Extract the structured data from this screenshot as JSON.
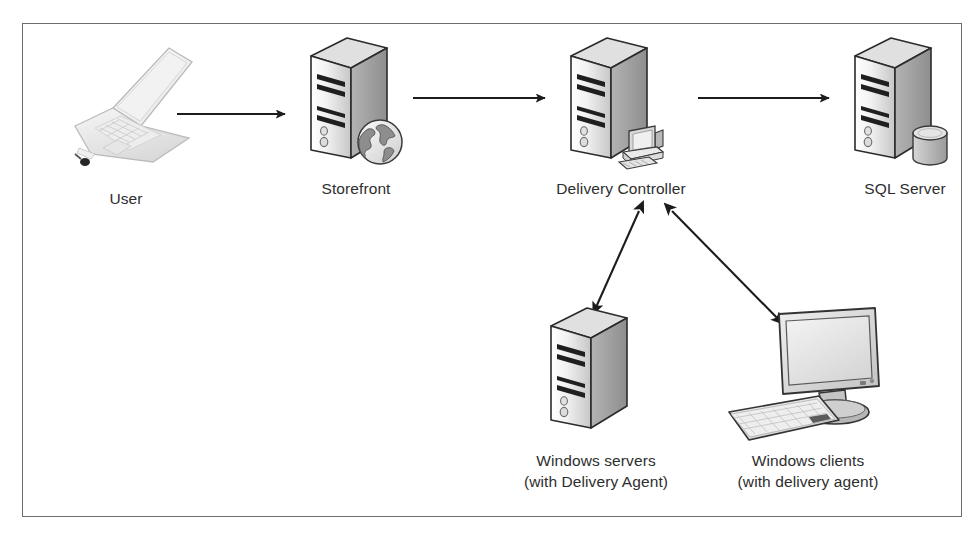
{
  "diagram": {
    "frame": {
      "border_color": "#6d6d6d"
    },
    "text_color": "#2e2e2e",
    "nodes": [
      {
        "id": "user",
        "icon": "laptop-icon",
        "label": "User",
        "sublabel": "",
        "x": 28,
        "y": 18,
        "width": 150,
        "label_y": 146
      },
      {
        "id": "storefront",
        "icon": "server-tower-globe-icon",
        "label": "Storefront",
        "sublabel": "",
        "x": 268,
        "y": 8,
        "width": 130,
        "label_y": 146
      },
      {
        "id": "delivery-controller",
        "icon": "server-tower-desktop-icon",
        "label": "Delivery Controller",
        "sublabel": "",
        "x": 528,
        "y": 8,
        "width": 140,
        "label_y": 146
      },
      {
        "id": "sql-server",
        "icon": "server-tower-database-icon",
        "label": "SQL Server",
        "sublabel": "",
        "x": 812,
        "y": 8,
        "width": 140,
        "label_y": 146
      },
      {
        "id": "windows-servers",
        "icon": "server-tower-icon",
        "label": "Windows servers",
        "sublabel": "(with Delivery Agent)",
        "x": 508,
        "y": 278,
        "width": 130,
        "label_y": 148
      },
      {
        "id": "windows-clients",
        "icon": "desktop-monitor-keyboard-icon",
        "label": "Windows clients",
        "sublabel": "(with delivery agent)",
        "x": 700,
        "y": 272,
        "width": 170,
        "label_y": 154
      }
    ],
    "edges": [
      {
        "id": "user-to-storefront",
        "from": "user",
        "to": "storefront",
        "style": "arrow-right",
        "direction": "one-way"
      },
      {
        "id": "storefront-to-delivery-controller",
        "from": "storefront",
        "to": "delivery-controller",
        "style": "arrow-right",
        "direction": "one-way"
      },
      {
        "id": "delivery-controller-to-sql-server",
        "from": "delivery-controller",
        "to": "sql-server",
        "style": "arrow-right",
        "direction": "one-way"
      },
      {
        "id": "delivery-controller-to-windows-servers",
        "from": "delivery-controller",
        "to": "windows-servers",
        "style": "arrow-double",
        "direction": "two-way"
      },
      {
        "id": "delivery-controller-to-windows-clients",
        "from": "delivery-controller",
        "to": "windows-clients",
        "style": "arrow-double",
        "direction": "two-way"
      }
    ]
  }
}
